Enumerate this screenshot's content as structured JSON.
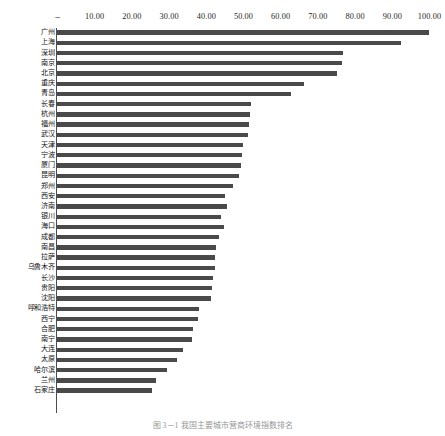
{
  "chart_data": {
    "type": "bar",
    "orientation": "horizontal",
    "title": "",
    "subtitle": "",
    "xlabel": "",
    "ylabel": "",
    "xlim": [
      0,
      100
    ],
    "grid": false,
    "legend": null,
    "bar_color": "#4a4a4a",
    "axis_color": "#4d4d4d",
    "x_tick_labels": [
      "–",
      "10.00",
      "20.00",
      "30.00",
      "40.00",
      "50.00",
      "60.00",
      "70.00",
      "80.00",
      "90.00",
      "100.00"
    ],
    "x_tick_values": [
      0,
      10,
      20,
      30,
      40,
      50,
      60,
      70,
      80,
      90,
      100
    ],
    "categories": [
      "广州",
      "上海",
      "深圳",
      "南京",
      "北京",
      "重庆",
      "青岛",
      "长春",
      "杭州",
      "福州",
      "武汉",
      "天津",
      "宁波",
      "厦门",
      "昆明",
      "郑州",
      "西安",
      "济南",
      "银川",
      "海口",
      "成都",
      "南昌",
      "拉萨",
      "乌鲁木齐",
      "长沙",
      "贵阳",
      "沈阳",
      "呼和浩特",
      "西宁",
      "合肥",
      "南宁",
      "大连",
      "太原",
      "哈尔滨",
      "兰州",
      "石家庄"
    ],
    "values": [
      100.0,
      92.5,
      77.0,
      76.6,
      75.4,
      66.5,
      63.0,
      52.2,
      51.9,
      51.6,
      51.3,
      50.0,
      49.7,
      49.4,
      49.0,
      47.3,
      45.2,
      45.6,
      44.2,
      44.8,
      43.6,
      42.8,
      42.4,
      42.4,
      42.0,
      41.8,
      41.5,
      38.3,
      37.9,
      36.5,
      36.2,
      33.8,
      32.3,
      29.5,
      26.5,
      25.5
    ]
  },
  "caption": {
    "text": "图 3－1  我国主要城市营商环境指数排名"
  }
}
